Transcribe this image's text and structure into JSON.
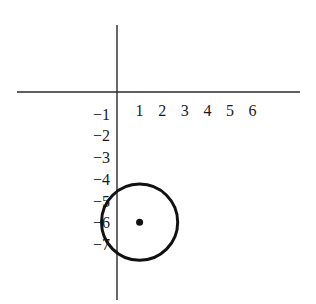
{
  "chart_data": {
    "type": "scatter",
    "title": "",
    "xlabel": "",
    "ylabel": "",
    "x_ticks": [
      1,
      2,
      3,
      4,
      5,
      6
    ],
    "x_tick_labels": [
      "1",
      "2",
      "3",
      "4",
      "5",
      "6"
    ],
    "y_ticks": [
      -1,
      -2,
      -3,
      -4,
      -5,
      -6,
      -7
    ],
    "y_tick_labels": [
      "−1",
      "−2",
      "−3",
      "−4",
      "−5",
      "−6",
      "−7"
    ],
    "xlim": [
      -4.5,
      8
    ],
    "ylim": [
      -9.5,
      4
    ],
    "grid": false,
    "points": [
      {
        "x": 1,
        "y": -6,
        "label": "center"
      }
    ],
    "circles": [
      {
        "cx": 1,
        "cy": -6,
        "r": 1.72
      }
    ],
    "colors": {
      "axis": "#2a2a2a",
      "ink": "#111111"
    }
  }
}
